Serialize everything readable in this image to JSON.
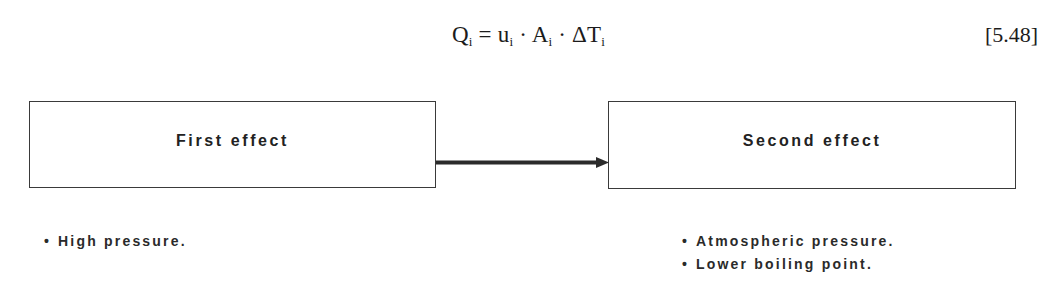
{
  "equation": {
    "lhs": "Q",
    "lhs_sub": "i",
    "equals": " = ",
    "u": "u",
    "u_sub": "i",
    "dot1": " · ",
    "A": "A",
    "A_sub": "i",
    "dot2": " · ",
    "dT": "ΔT",
    "dT_sub": "i",
    "number": "[5.48]"
  },
  "diagram": {
    "boxes": [
      {
        "label": "First effect",
        "notes": [
          "High pressure."
        ]
      },
      {
        "label": "Second effect",
        "notes": [
          "Atmospheric pressure.",
          "Lower boiling point."
        ]
      }
    ],
    "arrow": {
      "from": "First effect",
      "to": "Second effect",
      "direction": "right"
    },
    "bullet_glyph": "•"
  }
}
